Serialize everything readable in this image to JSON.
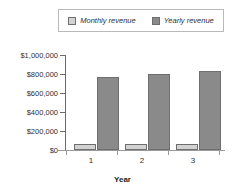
{
  "chart_data": {
    "type": "bar",
    "title": "",
    "subtitle": "",
    "xlabel": "Year",
    "ylabel": "",
    "categories": [
      "1",
      "2",
      "3"
    ],
    "series": [
      {
        "name": "Monthly revenue",
        "values": [
          60000,
          60000,
          62000
        ],
        "color": "#d2d2d2"
      },
      {
        "name": "Yearly revenue",
        "values": [
          765000,
          800000,
          830000
        ],
        "color": "#8a8a8a"
      }
    ],
    "ylim": [
      0,
      1000000
    ],
    "ytick_labels": [
      "$0",
      "$200,000",
      "$400,000",
      "$600,000",
      "$800,000",
      "$1,000,000"
    ],
    "ytick_values": [
      0,
      200000,
      400000,
      600000,
      800000,
      1000000
    ],
    "xtick_labels": [
      "1",
      "2",
      "3"
    ],
    "grid": false,
    "legend_position": "top",
    "legend_boxed": true
  },
  "legend": {
    "entries": [
      {
        "label": "Monthly revenue",
        "swatch": "legend-swatch-monthly"
      },
      {
        "label": "Yearly revenue",
        "swatch": "legend-swatch-yearly"
      }
    ]
  },
  "axes": {
    "x_title": "Year",
    "y_labels": [
      "$1,000,000",
      "$800,000",
      "$600,000",
      "$400,000",
      "$200,000",
      "$0"
    ],
    "x_labels": [
      "1",
      "2",
      "3"
    ]
  },
  "colors": {
    "monthly": "#d2d2d2",
    "yearly": "#8a8a8a",
    "bar_border": "#6e6e6e",
    "axis": "#6b6b6b",
    "text": "#2f2f2f",
    "background": "#ffffff"
  }
}
